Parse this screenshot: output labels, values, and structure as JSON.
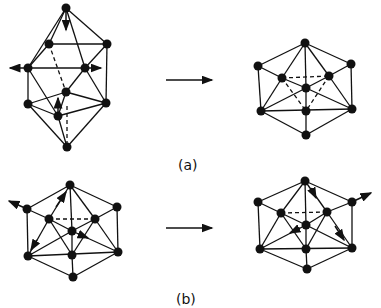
{
  "figure": {
    "labels": {
      "a": "(a)",
      "b": "(b)"
    },
    "panels": [
      {
        "id": "a",
        "left": "distorted bicapped cluster with displacement arrows",
        "right": "icosahedral-like cluster",
        "transition": "arrow"
      },
      {
        "id": "b",
        "left": "cluster with displacement arrows",
        "right": "cluster with displacement arrows",
        "transition": "arrow"
      }
    ],
    "colors": {
      "line": "#111111",
      "background": "#ffffff"
    }
  }
}
